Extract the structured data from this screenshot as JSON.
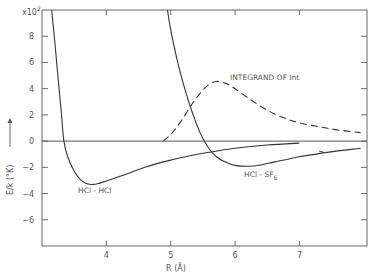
{
  "chart_data": {
    "type": "line",
    "title": "",
    "xlabel": "R (Å)",
    "ylabel": "E/k (°K)",
    "ylabel_arrow": "→",
    "y_multiplier": "x10",
    "y_multiplier_exp": "2",
    "xlim": [
      3.0,
      8.05
    ],
    "ylim": [
      -8,
      10
    ],
    "x_ticks": [
      4,
      5,
      6,
      7
    ],
    "x_tick_labels": [
      "4",
      "5",
      "6",
      "7"
    ],
    "y_ticks": [
      8,
      6,
      4,
      2,
      0,
      -2,
      -4,
      -6
    ],
    "y_tick_labels": [
      "8",
      "6",
      "4",
      "2",
      "0",
      "−2",
      "−4",
      "−6"
    ],
    "grid": false,
    "zero_line": true,
    "series": [
      {
        "name": "HCl - HCl",
        "style": "solid",
        "label": "HCl - HCl",
        "label_pos": [
          3.55,
          -3.9
        ],
        "x": [
          3.15,
          3.2,
          3.25,
          3.3,
          3.34,
          3.4,
          3.5,
          3.6,
          3.7,
          3.8,
          3.9,
          4.0,
          4.2,
          4.4,
          4.6,
          4.8,
          5.0,
          5.3,
          5.6,
          6.0,
          6.5,
          7.0
        ],
        "y": [
          10,
          7.5,
          4.8,
          2.2,
          0,
          -1.2,
          -2.3,
          -2.95,
          -3.25,
          -3.3,
          -3.2,
          -3.05,
          -2.7,
          -2.35,
          -2.0,
          -1.7,
          -1.45,
          -1.12,
          -0.85,
          -0.55,
          -0.3,
          -0.15
        ]
      },
      {
        "name": "HCl - SF6",
        "style": "solid",
        "label": "HCl - SF",
        "label_sub": "6",
        "label_pos": [
          6.0,
          -2.6
        ],
        "x": [
          4.95,
          5.0,
          5.1,
          5.2,
          5.3,
          5.4,
          5.5,
          5.6,
          5.7,
          5.85,
          6.0,
          6.2,
          6.4,
          6.6,
          6.8,
          7.0,
          7.3,
          7.6,
          7.95
        ],
        "y": [
          10,
          8.5,
          6.2,
          4.3,
          2.7,
          1.3,
          0.2,
          -0.6,
          -1.15,
          -1.6,
          -1.85,
          -1.92,
          -1.82,
          -1.6,
          -1.4,
          -1.2,
          -0.95,
          -0.75,
          -0.55
        ]
      },
      {
        "name": "INTEGRAND OF Int",
        "style": "dashed",
        "label": "INTEGRAND OF Int",
        "label_pos": [
          5.85,
          4.8
        ],
        "x": [
          4.88,
          5.0,
          5.1,
          5.2,
          5.3,
          5.4,
          5.5,
          5.6,
          5.7,
          5.8,
          5.9,
          6.0,
          6.2,
          6.4,
          6.6,
          6.8,
          7.0,
          7.3,
          7.6,
          7.95
        ],
        "y": [
          0,
          0.5,
          1.1,
          1.8,
          2.6,
          3.3,
          3.9,
          4.35,
          4.55,
          4.5,
          4.3,
          4.0,
          3.3,
          2.65,
          2.1,
          1.7,
          1.4,
          1.1,
          0.85,
          0.65
        ]
      }
    ],
    "annotations": [
      "INTEGRAND OF Int",
      "HCl - HCl",
      "HCl - SF6"
    ]
  },
  "labels": {
    "y_axis": "E/k  (°K)",
    "x_axis": "R (Å)",
    "multiplier": "x10",
    "multiplier_exp": "2",
    "series_hcl_hcl": "HCl - HCl",
    "series_hcl_sf6_base": "HCl - SF",
    "series_hcl_sf6_sub": "6",
    "series_integrand": "INTEGRAND OF Int"
  }
}
